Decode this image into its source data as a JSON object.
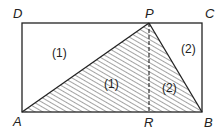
{
  "diagram": {
    "vertices": {
      "D": {
        "label": "D",
        "x": 22,
        "y": 23
      },
      "P": {
        "label": "P",
        "x": 149,
        "y": 23
      },
      "C": {
        "label": "C",
        "x": 202,
        "y": 23
      },
      "A": {
        "label": "A",
        "x": 22,
        "y": 112
      },
      "R": {
        "label": "R",
        "x": 149,
        "y": 112
      },
      "B": {
        "label": "B",
        "x": 202,
        "y": 112
      }
    },
    "regions": {
      "left_unshaded": "(1)",
      "right_unshaded": "(2)",
      "left_shaded": "(1)",
      "right_shaded": "(2)"
    },
    "colors": {
      "stroke": "#222222",
      "hatch": "#333333",
      "background": "#ffffff"
    }
  }
}
